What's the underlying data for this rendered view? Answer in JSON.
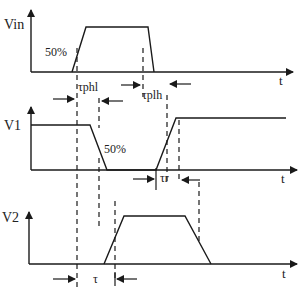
{
  "diagram": {
    "type": "timing-diagram",
    "signals": [
      {
        "name": "Vin",
        "label": "Vin",
        "annotation": "50%"
      },
      {
        "name": "V1",
        "label": "V1",
        "annotation": "50%"
      },
      {
        "name": "V2",
        "label": "V2"
      }
    ],
    "axis_label": "t",
    "intervals": {
      "tphl": "τphl",
      "tplh": "τplh",
      "tr": "τr",
      "tau": "τ"
    },
    "colors": {
      "line": "#1a1a1a",
      "background": "#ffffff"
    }
  }
}
